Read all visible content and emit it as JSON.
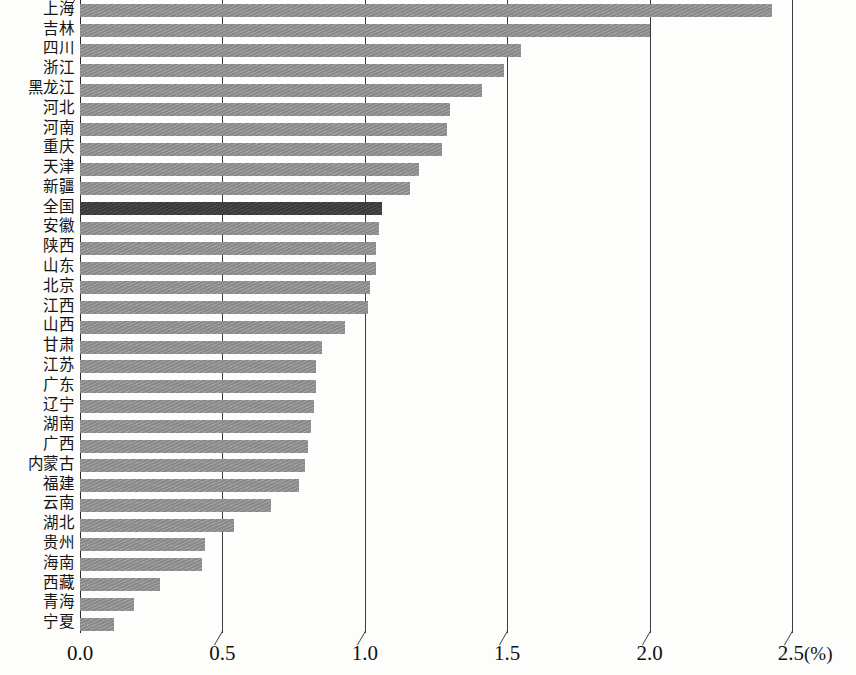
{
  "chart_data": {
    "type": "bar",
    "orientation": "horizontal",
    "title": "",
    "subtitle": "",
    "xlabel": "(%)",
    "ylabel": "",
    "xlim": [
      0.0,
      2.5
    ],
    "xticks": [
      "0.0",
      "0.5",
      "1.0",
      "1.5",
      "2.0",
      "2.5"
    ],
    "xtick_values": [
      0.0,
      0.5,
      1.0,
      1.5,
      2.0,
      2.5
    ],
    "unit_label": "(%)",
    "grid": "vertical",
    "legend": "none",
    "highlight_category": "全国",
    "colors": {
      "bar": "#898989",
      "highlight_bar": "#3a3a3a",
      "axis": "#2a2a2a",
      "grid": "#3c3c3c",
      "background": "#fdfdfb",
      "text": "#141414"
    },
    "categories": [
      "上海",
      "吉林",
      "四川",
      "浙江",
      "黑龙江",
      "河北",
      "河南",
      "重庆",
      "天津",
      "新疆",
      "全国",
      "安徽",
      "陕西",
      "山东",
      "北京",
      "江西",
      "山西",
      "甘肃",
      "江苏",
      "广东",
      "辽宁",
      "湖南",
      "广西",
      "内蒙古",
      "福建",
      "云南",
      "湖北",
      "贵州",
      "海南",
      "西藏",
      "青海",
      "宁夏"
    ],
    "values": [
      2.43,
      2.0,
      1.55,
      1.49,
      1.41,
      1.3,
      1.29,
      1.27,
      1.19,
      1.16,
      1.06,
      1.05,
      1.04,
      1.04,
      1.02,
      1.01,
      0.93,
      0.85,
      0.83,
      0.83,
      0.82,
      0.81,
      0.8,
      0.79,
      0.77,
      0.67,
      0.54,
      0.44,
      0.43,
      0.28,
      0.19,
      0.12
    ]
  }
}
